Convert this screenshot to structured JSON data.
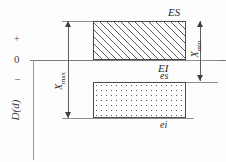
{
  "diagram": {
    "axis": {
      "plus_label": "+",
      "zero_label": "0",
      "minus_label": "–",
      "ordinate_caption": "D(d)"
    },
    "zones": [
      {
        "name": "hole-tolerance-zone",
        "fill": "hatched",
        "upper_deviation_label": "ES",
        "lower_deviation_label": "EI"
      },
      {
        "name": "shaft-tolerance-zone",
        "fill": "stippled",
        "upper_deviation_label": "es",
        "lower_deviation_label": "ei"
      }
    ],
    "deviations": {
      "ES": "ES",
      "EI": "EI",
      "es": "es",
      "ei": "ei"
    },
    "dimensions": [
      {
        "name": "maximum-clearance",
        "symbol": "X",
        "subscript": "max",
        "text": "X"
      },
      {
        "name": "minimum-clearance",
        "symbol": "X",
        "subscript": "min",
        "text": "X"
      }
    ],
    "dimension_labels": {
      "xmax_symbol": "X",
      "xmax_subscript": "max",
      "xmin_symbol": "X",
      "xmin_subscript": "min"
    },
    "colors": {
      "line": "#8f8f8f",
      "outline": "#4a4a4a",
      "text": "#2b2b2b",
      "background": "#fdfdfd"
    }
  }
}
